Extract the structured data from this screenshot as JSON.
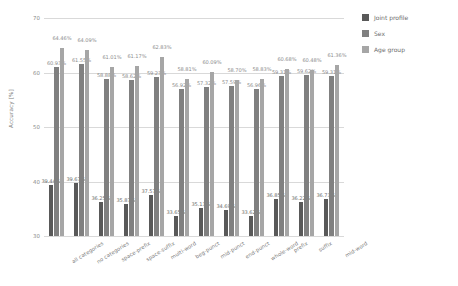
{
  "chart_data": {
    "type": "bar",
    "title": "",
    "xlabel": "",
    "ylabel": "Accuracy [%]",
    "ylim": [
      30,
      70
    ],
    "yticks": [
      30,
      40,
      50,
      60,
      70
    ],
    "grid": true,
    "legend_position": "right",
    "categories": [
      "all categories",
      "no categories",
      "space-prefix",
      "space-suffix",
      "multi-word",
      "beg-punct",
      "mid-punct",
      "end-punct",
      "whole-word",
      "prefix",
      "suffix",
      "mid-word"
    ],
    "series": [
      {
        "name": "Joint profile",
        "color": "#595959",
        "values": [
          39.44,
          39.67,
          36.25,
          35.87,
          37.57,
          33.65,
          35.13,
          34.69,
          33.62,
          36.85,
          36.22,
          36.73
        ],
        "labels": [
          "39.44%",
          "39.67%",
          "36.25%",
          "35.87%",
          "37.57%",
          "33.65%",
          "35.13%",
          "34.69%",
          "33.62%",
          "36.85%",
          "36.22%",
          "36.73%"
        ]
      },
      {
        "name": "Sex",
        "color": "#808080",
        "values": [
          60.93,
          61.55,
          58.88,
          58.62,
          59.23,
          56.92,
          57.32,
          57.59,
          56.96,
          59.31,
          59.62,
          59.31
        ],
        "labels": [
          "60.93%",
          "61.55%",
          "58.88%",
          "58.62%",
          "59.23%",
          "56.92%",
          "57.32%",
          "57.59%",
          "56.96%",
          "59.31%",
          "59.62%",
          "59.31%"
        ]
      },
      {
        "name": "Age group",
        "color": "#a6a6a6",
        "values": [
          64.46,
          64.09,
          61.01,
          61.17,
          62.83,
          58.81,
          60.09,
          58.7,
          58.83,
          60.68,
          60.48,
          61.36
        ],
        "labels": [
          "64.46%",
          "64.09%",
          "61.01%",
          "61.17%",
          "62.83%",
          "58.81%",
          "60.09%",
          "58.70%",
          "58.83%",
          "60.68%",
          "60.48%",
          "61.36%"
        ]
      }
    ]
  }
}
